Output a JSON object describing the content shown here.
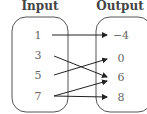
{
  "diagram": {
    "input_title": "Input",
    "output_title": "Output",
    "inputs": [
      "1",
      "3",
      "5",
      "7"
    ],
    "outputs": [
      "−4",
      "0",
      "6",
      "8"
    ],
    "mappings": [
      {
        "from": "1",
        "to": "−4"
      },
      {
        "from": "3",
        "to": "6"
      },
      {
        "from": "5",
        "to": "0"
      },
      {
        "from": "7",
        "to": "6"
      },
      {
        "from": "7",
        "to": "8"
      }
    ]
  }
}
